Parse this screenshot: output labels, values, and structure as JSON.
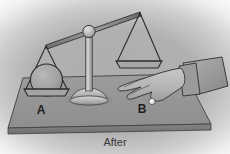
{
  "figure": {
    "title": "After",
    "caption_label": "After",
    "background_color": "#a8a8a8",
    "line_color": "#2b2b2b",
    "table_color": "#9a9a9a",
    "table_edge_color": "#7c7c7c",
    "metal_color": "#b4b4b4",
    "skin_color": "#b9b9b9",
    "sleeve_color": "#a0a0a0",
    "ball_color": "#f2f2f2"
  },
  "scale": {
    "pan_a": {
      "label": "A",
      "state": "down",
      "contents": "sphere"
    },
    "pan_b": {
      "label": "B",
      "state": "up",
      "contents": "empty"
    },
    "beam": {
      "tilt": "left-down"
    },
    "pivot": {
      "name": "fulcrum-knob"
    }
  },
  "hand": {
    "label": "hand",
    "holding": "small-white-ball",
    "pointing_to": "B"
  }
}
